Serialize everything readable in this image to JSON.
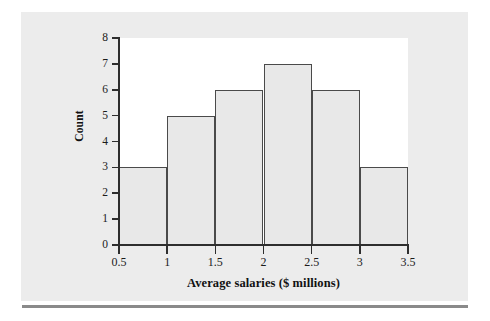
{
  "chart_data": {
    "type": "bar",
    "title": "",
    "subtitle": "",
    "xlabel": "Average salaries ($ millions)",
    "ylabel": "Count",
    "categories": [
      "0.5-1",
      "1-1.5",
      "1.5-2",
      "2-2.5",
      "2.5-3",
      "3-3.5"
    ],
    "bin_edges": [
      0.5,
      1,
      1.5,
      2,
      2.5,
      3,
      3.5
    ],
    "values": [
      3,
      5,
      6,
      7,
      6,
      3
    ],
    "bins": [
      {
        "left": 0.5,
        "right": 1,
        "count": 3
      },
      {
        "left": 1,
        "right": 1.5,
        "count": 5
      },
      {
        "left": 1.5,
        "right": 2,
        "count": 6
      },
      {
        "left": 2,
        "right": 2.5,
        "count": 7
      },
      {
        "left": 2.5,
        "right": 3,
        "count": 6
      },
      {
        "left": 3,
        "right": 3.5,
        "count": 3
      }
    ],
    "xlim": [
      0.5,
      3.5
    ],
    "ylim": [
      0,
      8
    ],
    "x_ticks": [
      0.5,
      1,
      1.5,
      2,
      2.5,
      3,
      3.5
    ],
    "x_tick_labels": [
      "0.5",
      "1",
      "1.5",
      "2",
      "2.5",
      "3",
      "3.5"
    ],
    "y_ticks": [
      0,
      1,
      2,
      3,
      4,
      5,
      6,
      7,
      8
    ],
    "y_tick_labels": [
      "0",
      "1",
      "2",
      "3",
      "4",
      "5",
      "6",
      "7",
      "8"
    ],
    "grid": false,
    "legend": null,
    "legend_position": "none",
    "annotations": [],
    "colors": {
      "bar_fill": "#e8e8e8",
      "bar_edge": "#4a4a4a",
      "axis": "#2e2e2e",
      "text": "#1b1b1b",
      "plot_background": "#ffffff",
      "card_background": "#ececec",
      "rule": "#8a8a8a"
    }
  }
}
